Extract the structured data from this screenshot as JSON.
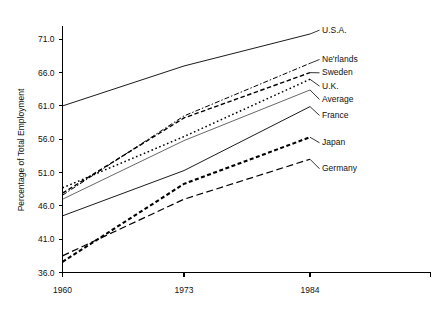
{
  "chart_data": {
    "type": "line",
    "title": "",
    "subtitle": "",
    "xlabel": "",
    "ylabel": "Percentage of Total Employment",
    "x": [
      1960,
      1973,
      1984
    ],
    "xtick_labels": [
      "1960",
      "1973",
      "1984"
    ],
    "ytick_labels": [
      "36.0",
      "41.0",
      "46.0",
      "51.0",
      "56.0",
      "61.0",
      "66.0",
      "71.0"
    ],
    "ytick_values": [
      36.0,
      41.0,
      46.0,
      51.0,
      56.0,
      61.0,
      66.0,
      71.0
    ],
    "ylim": [
      36.0,
      73.0
    ],
    "xlim": [
      1960,
      1987
    ],
    "grid": false,
    "legend_position": "right-inline-labels",
    "line_color": "#000000",
    "series": [
      {
        "name": "U.S.A.",
        "label": "U.S.A.",
        "values": [
          61.0,
          67.0,
          71.8
        ],
        "style": "solid",
        "dash": "none",
        "width": 0.9
      },
      {
        "name": "Ne'rlands",
        "label": "Ne'rlands",
        "values": [
          47.6,
          59.5,
          67.4
        ],
        "style": "dash-dot",
        "dash": "5,2,1.5,2",
        "width": 1.0
      },
      {
        "name": "Sweden",
        "label": "Sweden",
        "values": [
          47.9,
          59.2,
          66.0
        ],
        "style": "dashed",
        "dash": "4.5,2.5",
        "width": 1.4
      },
      {
        "name": "U.K.",
        "label": "U.K.",
        "values": [
          48.7,
          56.4,
          65.0
        ],
        "style": "dotted",
        "dash": "1.6,2.6",
        "width": 1.5
      },
      {
        "name": "Average",
        "label": "Average",
        "values": [
          47.0,
          55.8,
          63.4
        ],
        "style": "solid-thin",
        "dash": "none",
        "width": 0.6
      },
      {
        "name": "France",
        "label": "France",
        "values": [
          44.5,
          51.3,
          60.9
        ],
        "style": "solid",
        "dash": "none",
        "width": 0.9
      },
      {
        "name": "Japan",
        "label": "Japan",
        "values": [
          37.6,
          49.3,
          56.3
        ],
        "style": "thick-dashed",
        "dash": "4,2.5",
        "width": 2.1
      },
      {
        "name": "Germany",
        "label": "Germany",
        "values": [
          38.5,
          47.0,
          53.0
        ],
        "style": "long-dash",
        "dash": "7,3.5",
        "width": 1.2
      }
    ],
    "labels_right": [
      {
        "text": "U.S.A.",
        "y_value": 72.0
      },
      {
        "text": "Ne'rlands",
        "y_value": 67.6
      },
      {
        "text": "Sweden",
        "y_value": 65.6
      },
      {
        "text": "U.K.",
        "y_value": 63.6
      },
      {
        "text": "Average",
        "y_value": 61.6
      },
      {
        "text": "France",
        "y_value": 59.2
      },
      {
        "text": "Japan",
        "y_value": 55.1
      },
      {
        "text": "Germany",
        "y_value": 51.2
      }
    ]
  }
}
